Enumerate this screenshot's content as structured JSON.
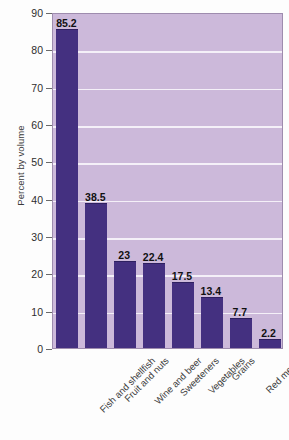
{
  "chart_data": {
    "type": "bar",
    "title": "",
    "subtitle": "",
    "xlabel": "",
    "ylabel": "Percent by volume",
    "ylim": [
      0,
      90
    ],
    "y_ticks": [
      0,
      10,
      20,
      30,
      40,
      50,
      60,
      70,
      80,
      90
    ],
    "y_tick_labels": [
      "0",
      "10",
      "20",
      "30",
      "40",
      "50",
      "60",
      "70",
      "80",
      "90"
    ],
    "grid": true,
    "legend": "none",
    "categories": [
      "Fish and shellfish",
      "Fruit and nuts",
      "Wine and beer",
      "Sweeteners",
      "Vegetables",
      "Grains",
      "Red meats",
      "Dairy products"
    ],
    "values": [
      85.2,
      38.5,
      23,
      22.4,
      17.5,
      13.4,
      7.7,
      2.2
    ],
    "value_labels": [
      "85.2",
      "38.5",
      "23",
      "22.4",
      "17.5",
      "13.4",
      "7.7",
      "2.2"
    ],
    "colors": {
      "bar": "#443080",
      "plot_background": "#ccb9da",
      "gridline": "#f4f0f8",
      "plot_border": "#9e8cae",
      "page_background": "#fdfdfd",
      "text": "#2e2e2e"
    }
  }
}
